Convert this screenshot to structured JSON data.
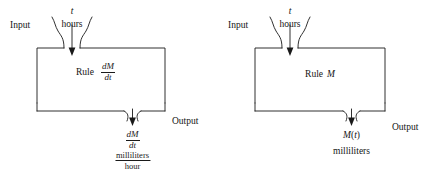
{
  "figure": {
    "type": "diagram",
    "background_color": "#ffffff",
    "line_color": "#1a1a1a"
  },
  "diagrams": [
    {
      "id": "left",
      "input_label": "Input",
      "output_label": "Output",
      "input_variable": "t",
      "input_units": "hours",
      "rule_word": "Rule",
      "rule_expression_numerator": "dM",
      "rule_expression_denominator": "dt",
      "output_expression_numerator": "dM",
      "output_expression_denominator": "dt",
      "output_units_numerator": "milliliters",
      "output_units_denominator": "hour"
    },
    {
      "id": "right",
      "input_label": "Input",
      "output_label": "Output",
      "input_variable": "t",
      "input_units": "hours",
      "rule_word": "Rule",
      "rule_expression": "M",
      "output_expression_function": "M",
      "output_expression_argument": "t",
      "output_units": "milliliters"
    }
  ]
}
